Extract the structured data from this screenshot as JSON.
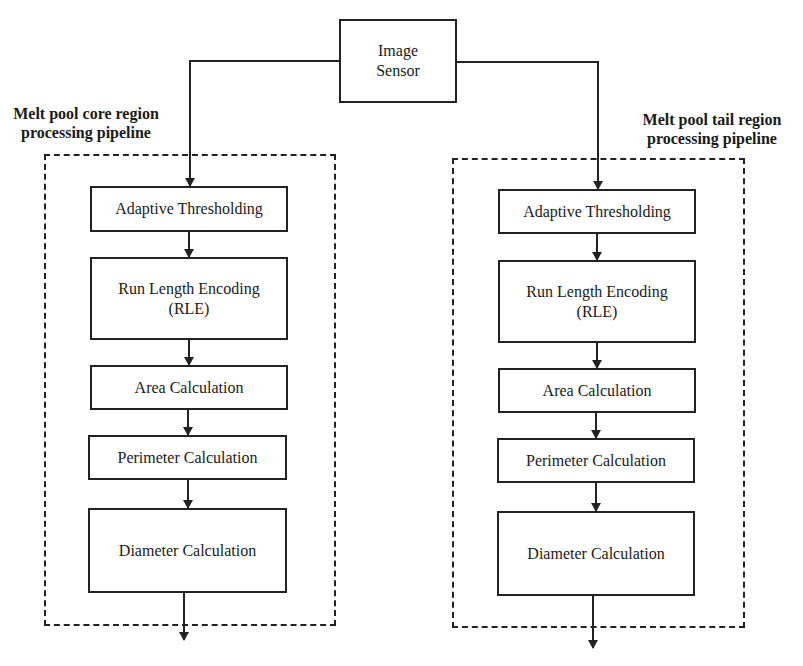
{
  "diagram": {
    "source": {
      "label_line1": "Image",
      "label_line2": "Sensor"
    },
    "pipelines": [
      {
        "title_line1": "Melt pool core region",
        "title_line2": "processing pipeline",
        "steps": [
          {
            "line1": "Adaptive Thresholding",
            "line2": ""
          },
          {
            "line1": "Run Length Encoding",
            "line2": "(RLE)"
          },
          {
            "line1": "Area Calculation",
            "line2": ""
          },
          {
            "line1": "Perimeter Calculation",
            "line2": ""
          },
          {
            "line1": "Diameter Calculation",
            "line2": ""
          }
        ]
      },
      {
        "title_line1": "Melt pool tail region",
        "title_line2": "processing pipeline",
        "steps": [
          {
            "line1": "Adaptive Thresholding",
            "line2": ""
          },
          {
            "line1": "Run Length Encoding",
            "line2": "(RLE)"
          },
          {
            "line1": "Area Calculation",
            "line2": ""
          },
          {
            "line1": "Perimeter Calculation",
            "line2": ""
          },
          {
            "line1": "Diameter Calculation",
            "line2": ""
          }
        ]
      }
    ],
    "colors": {
      "stroke": "#222222",
      "background": "#ffffff"
    }
  }
}
